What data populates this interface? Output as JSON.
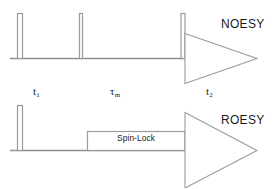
{
  "diagram": {
    "type": "nmr-pulse-sequence",
    "width": 278,
    "height": 188,
    "background_color": "#ffffff",
    "stroke_color": "#8f8f8f",
    "text_color": "#1a1a1a"
  },
  "sequences": [
    {
      "id": "noesy",
      "title": "NOESY",
      "baseline_y": 58,
      "pulses": [
        {
          "name": "first-90-pulse",
          "x": 17,
          "width": 5,
          "height": 45
        },
        {
          "name": "second-90-pulse",
          "x": 79,
          "width": 3,
          "height": 45
        },
        {
          "name": "third-90-pulse",
          "x": 181,
          "width": 4,
          "height": 45
        }
      ],
      "acquisition": {
        "name": "fid-triangle",
        "start_x": 185,
        "apex_x": 257,
        "half_height": 25
      }
    },
    {
      "id": "roesy",
      "title": "ROESY",
      "baseline_y": 150,
      "pulses": [
        {
          "name": "first-90-pulse",
          "x": 17,
          "width": 5,
          "height": 45
        }
      ],
      "spin_lock": {
        "label": "Spin-Lock",
        "x": 87,
        "width": 98,
        "height": 19
      },
      "acquisition": {
        "name": "fid-triangle",
        "start_x": 185,
        "apex_x": 257,
        "half_height": 38
      }
    }
  ],
  "time_labels": [
    {
      "id": "t1",
      "symbol": "t",
      "subscript": "1",
      "x": 33
    },
    {
      "id": "tm",
      "symbol": "τ",
      "subscript": "m",
      "x": 110
    },
    {
      "id": "t2",
      "symbol": "t",
      "subscript": "2",
      "x": 206
    }
  ]
}
